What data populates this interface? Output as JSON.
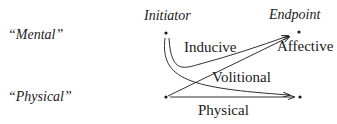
{
  "rows": {
    "mental": "“Mental”",
    "physical": "“Physical”"
  },
  "columns": {
    "initiator": "Initiator",
    "endpoint": "Endpoint"
  },
  "edges": {
    "inducive": "Inducive",
    "affective": "Affective",
    "volitional": "Volitional",
    "physical": "Physical"
  }
}
